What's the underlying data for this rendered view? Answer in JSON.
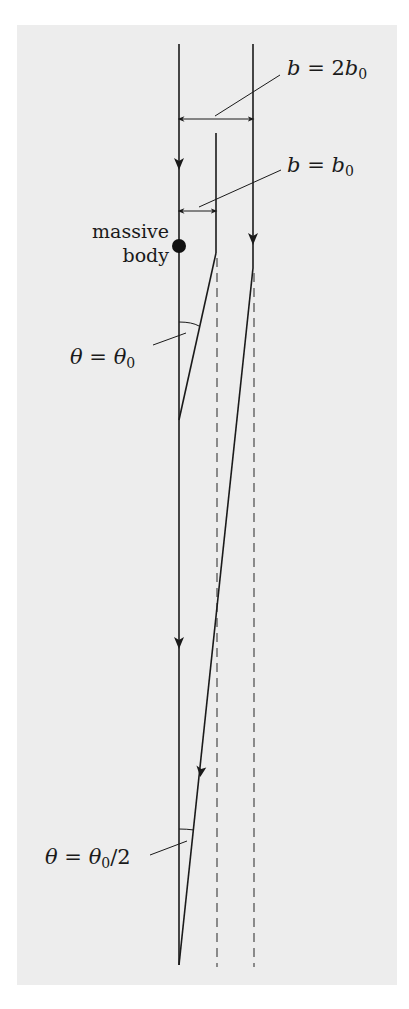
{
  "diagram": {
    "labels": {
      "massive_body_line1": "massive",
      "massive_body_line2": "body",
      "b_outer": {
        "var": "b",
        "eq": "=",
        "coef": "2",
        "base": "b",
        "sub": "0"
      },
      "b_inner": {
        "var": "b",
        "eq": "=",
        "base": "b",
        "sub": "0"
      },
      "theta_top": {
        "var": "θ",
        "eq": "=",
        "base": "θ",
        "sub": "0"
      },
      "theta_bottom": {
        "var": "θ",
        "eq": "=",
        "base": "θ",
        "sub": "0",
        "suffix": "/2"
      }
    },
    "colors": {
      "background": "#ededed",
      "line": "#1a1a1a",
      "dashed": "#555555"
    },
    "elements": {
      "reference_line": "vertical line through massive body",
      "inner_ray": "light ray with impact parameter b0 deflected by θ0",
      "outer_ray": "light ray with impact parameter 2b0 deflected by θ0/2"
    }
  }
}
